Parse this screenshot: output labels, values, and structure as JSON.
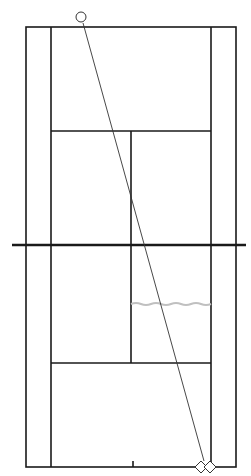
{
  "diagram": {
    "type": "tennis-court-shot-diagram",
    "colors": {
      "lines": "#1a1a1a",
      "net": "#1a1a1a",
      "trajectory": "#333333",
      "wave": "#c0c0c0",
      "markers": "#333333"
    },
    "court": {
      "doubles_left_x": 26,
      "doubles_right_x": 236,
      "singles_left_x": 51,
      "singles_right_x": 211,
      "top_baseline_y": 27,
      "bottom_baseline_y": 467,
      "top_service_y": 131,
      "bottom_service_y": 363,
      "center_x": 131,
      "net_y": 245,
      "net_left_x": 12,
      "net_right_x": 246
    },
    "ball_start": {
      "shape": "circle",
      "cx": 81,
      "cy": 17,
      "r": 5
    },
    "trajectory": {
      "x1": 83,
      "y1": 31,
      "x2": 204,
      "y2": 463
    },
    "wave": {
      "y": 304,
      "x1": 131,
      "x2": 211
    },
    "players": [
      {
        "shape": "diamond",
        "cx": 201,
        "cy": 467,
        "size": 6
      },
      {
        "shape": "diamond",
        "cx": 210,
        "cy": 467,
        "size": 6
      }
    ]
  }
}
